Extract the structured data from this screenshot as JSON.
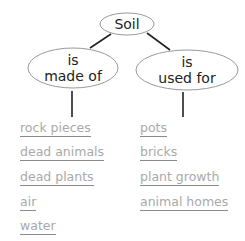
{
  "diagram": {
    "root": {
      "label": "Soil"
    },
    "branches": [
      {
        "label_line1": "is",
        "label_line2": "made of",
        "items": [
          "rock pieces",
          "dead animals",
          "dead plants",
          "air",
          "water"
        ]
      },
      {
        "label_line1": "is",
        "label_line2": "used for",
        "items": [
          "pots",
          "bricks",
          "plant growth",
          "animal homes"
        ]
      }
    ],
    "colors": {
      "text": "#222222",
      "item_text": "#a9a9a9",
      "underline": "#8a8a8a",
      "outline": "#999999",
      "connector": "#222222"
    }
  }
}
